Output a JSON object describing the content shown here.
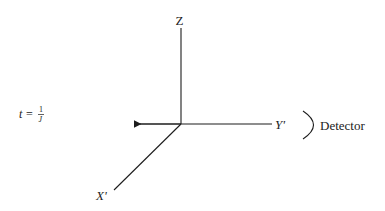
{
  "diagram": {
    "axes": {
      "z_label": "Z",
      "y_label": "Y'",
      "x_label": "X'"
    },
    "equation": {
      "lhs": "t",
      "equals": "=",
      "numerator": "1",
      "denominator": "J"
    },
    "detector_label": "Detector",
    "colors": {
      "line": "#1c1c1c",
      "background": "#ffffff"
    }
  }
}
